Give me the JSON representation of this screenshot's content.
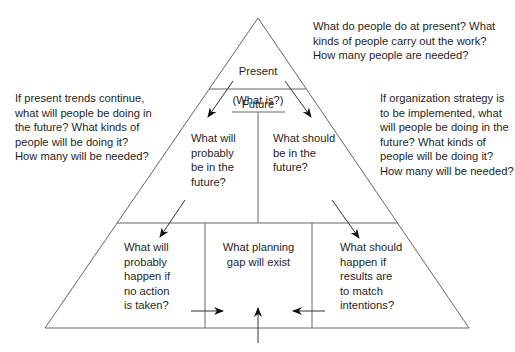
{
  "diagram": {
    "present": {
      "title": "Present",
      "subtitle": "(What is?)",
      "question": "What do people do at present? What\nkinds of people carry out the work?\nHow many people are needed?"
    },
    "future": {
      "title": "Future",
      "left_box": "What will\nprobably\nbe in the\nfuture?",
      "right_box": "What should\nbe in the\nfuture?"
    },
    "side_notes": {
      "left": "If present trends continue,\nwhat will people be doing in\nthe future? What kinds of\npeople will be doing it?\nHow many will be needed?",
      "right": "If organization strategy is\nto be implemented, what\nwill people be doing in the\nfuture? What kinds of\npeople will be doing it?\nHow many will be needed?"
    },
    "base": {
      "left_box": "What will\nprobably\nhappen if\nno action\nis taken?",
      "center_box": "What planning\ngap will exist",
      "right_box": "What should\nhappen if\nresults are\nto match\nintentions?"
    },
    "colors": {
      "line": "#555555",
      "arrow": "#111111",
      "text": "#1f1f1f"
    }
  }
}
